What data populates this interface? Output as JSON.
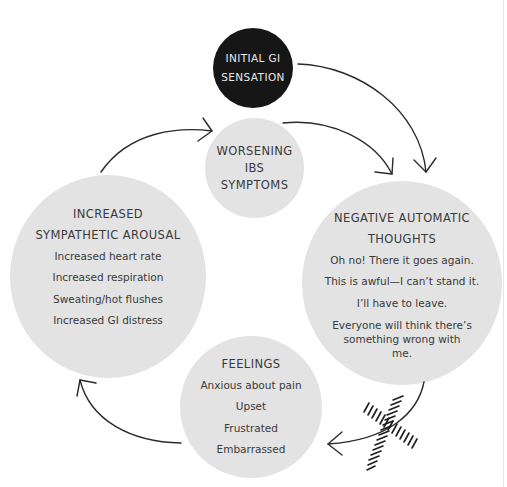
{
  "diagram": {
    "nodes": {
      "initial": {
        "heading_lines": [
          "INITIAL GI",
          "SENSATION"
        ]
      },
      "worsening": {
        "heading_lines": [
          "WORSENING",
          "IBS",
          "SYMPTOMS"
        ]
      },
      "negative_thoughts": {
        "heading_lines": [
          "NEGATIVE AUTOMATIC",
          "THOUGHTS"
        ],
        "items": [
          "Oh no! There it goes again.",
          "This is awful—I can’t stand it.",
          "I’ll have to leave.",
          "Everyone will think there’s something wrong with me."
        ]
      },
      "feelings": {
        "heading_lines": [
          "FEELINGS"
        ],
        "items": [
          "Anxious about pain",
          "Upset",
          "Frustrated",
          "Embarrassed"
        ]
      },
      "arousal": {
        "heading_lines": [
          "INCREASED",
          "SYMPATHETIC AROUSAL"
        ],
        "items": [
          "Increased heart rate",
          "Increased respiration",
          "Sweating/hot flushes",
          "Increased GI distress"
        ]
      }
    },
    "arrows": [
      {
        "from": "initial",
        "to": "negative_thoughts"
      },
      {
        "from": "worsening",
        "to": "negative_thoughts"
      },
      {
        "from": "negative_thoughts",
        "to": "feelings",
        "crossed_out": true
      },
      {
        "from": "feelings",
        "to": "arousal"
      },
      {
        "from": "arousal",
        "to": "worsening"
      }
    ],
    "colors": {
      "node_fill": "#e3e3e3",
      "start_node_fill": "#161616",
      "text": "#3a3a3a",
      "arrow": "#2a2a2a"
    }
  }
}
